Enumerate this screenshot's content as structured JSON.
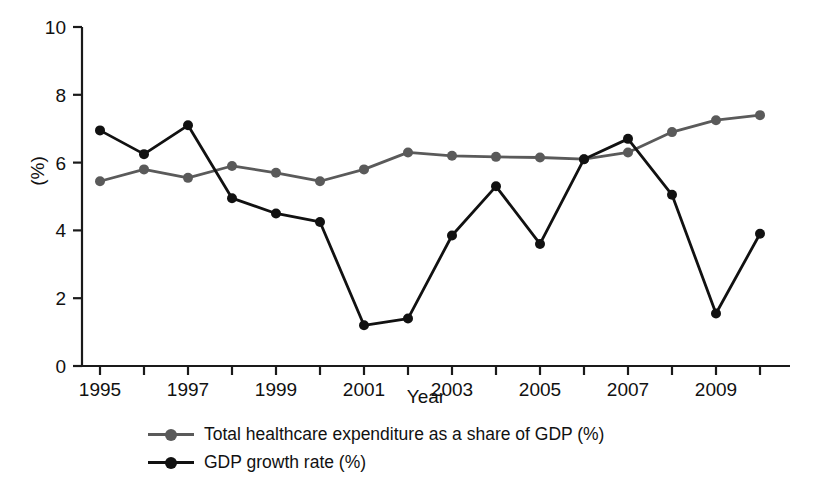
{
  "chart_data": {
    "type": "line",
    "title": "",
    "xlabel": "Year",
    "ylabel": "(%)",
    "x": [
      1995,
      1996,
      1997,
      1998,
      1999,
      2000,
      2001,
      2002,
      2003,
      2004,
      2005,
      2006,
      2007,
      2008,
      2009,
      2010
    ],
    "categories": [
      "1995",
      "1996",
      "1997",
      "1998",
      "1999",
      "2000",
      "2001",
      "2002",
      "2003",
      "2004",
      "2005",
      "2006",
      "2007",
      "2008",
      "2009",
      "2010"
    ],
    "xlim": [
      1995,
      2010
    ],
    "ylim": [
      0,
      10
    ],
    "yticks": [
      0,
      2,
      4,
      6,
      8,
      10
    ],
    "ytick_labels": [
      "0",
      "2",
      "4",
      "6",
      "8",
      "10"
    ],
    "xticks": [
      1995,
      1996,
      1997,
      1998,
      1999,
      2000,
      2001,
      2002,
      2003,
      2004,
      2005,
      2006,
      2007,
      2008,
      2009,
      2010
    ],
    "xtick_labels_shown": [
      "1995",
      "1997",
      "1999",
      "2001",
      "2003",
      "2005",
      "2007",
      "2009"
    ],
    "grid": false,
    "legend_position": "bottom",
    "series": [
      {
        "name": "Total healthcare expenditure as a share of GDP (%)",
        "color": "#5a5a5a",
        "marker": "circle",
        "values": [
          5.45,
          5.8,
          5.55,
          5.9,
          5.7,
          5.45,
          5.8,
          6.3,
          6.2,
          6.17,
          6.15,
          6.1,
          6.3,
          6.9,
          7.25,
          7.4
        ]
      },
      {
        "name": "GDP growth rate (%)",
        "color": "#111111",
        "marker": "circle",
        "values": [
          6.95,
          6.25,
          7.1,
          4.95,
          4.5,
          4.25,
          1.2,
          1.4,
          3.85,
          5.3,
          3.6,
          6.1,
          6.7,
          5.05,
          1.55,
          3.9
        ]
      }
    ]
  },
  "axis": {
    "y_title": "(%)",
    "x_title": "Year"
  },
  "legend": {
    "items": [
      {
        "label": "Total healthcare expenditure as a share of GDP (%)",
        "color": "#5a5a5a"
      },
      {
        "label": "GDP growth rate (%)",
        "color": "#111111"
      }
    ]
  },
  "colors": {
    "healthcare_series": "#5a5a5a",
    "gdp_series": "#111111",
    "axis": "#1a1a1a",
    "background": "#ffffff"
  }
}
